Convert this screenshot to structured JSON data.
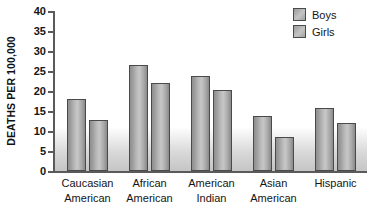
{
  "chart_data": {
    "type": "bar",
    "title": "",
    "xlabel": "",
    "ylabel": "DEATHS PER 100,000",
    "ylim": [
      0,
      40
    ],
    "ytick_step": 5,
    "yticks": [
      "40",
      "35",
      "30",
      "25",
      "20",
      "15",
      "10",
      "5",
      "0"
    ],
    "grid": false,
    "legend_position": "top-right",
    "categories": [
      "Caucasian American",
      "African American",
      "American Indian",
      "Asian American",
      "Hispanic"
    ],
    "category_lines": [
      [
        "Caucasian",
        "American"
      ],
      [
        "African",
        "American"
      ],
      [
        "American",
        "Indian"
      ],
      [
        "Asian",
        "American"
      ],
      [
        "Hispanic",
        ""
      ]
    ],
    "series": [
      {
        "name": "Boys",
        "values": [
          17.9,
          26.5,
          23.8,
          13.8,
          15.7
        ]
      },
      {
        "name": "Girls",
        "values": [
          12.8,
          22.0,
          20.2,
          8.5,
          11.9
        ]
      }
    ]
  },
  "legend": {
    "items": [
      {
        "label": "Boys"
      },
      {
        "label": "Girls"
      }
    ]
  },
  "colors": {
    "bar_border": "#4a4a4a",
    "bar_fill_light": "#c6c6c6",
    "bar_fill_dark": "#8a8a8a",
    "axis": "#5a5a5a",
    "text": "#141414",
    "background": "#ffffff"
  }
}
